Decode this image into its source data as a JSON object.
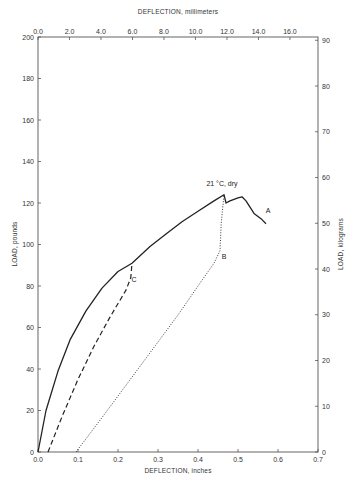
{
  "chart_data": {
    "type": "line",
    "title": "",
    "xlabel": "DEFLECTION, inches",
    "ylabel": "LOAD, pounds",
    "x2label": "DEFLECTION, millimeters",
    "y2label": "LOAD, kilograms",
    "xlim": [
      0.0,
      0.7
    ],
    "ylim": [
      0,
      200
    ],
    "x2lim_mm": [
      0.0,
      17.78
    ],
    "y2lim_kg": [
      0,
      90.7
    ],
    "grid": false,
    "x_ticks": [
      "0.0",
      "0.1",
      "0.2",
      "0.3",
      "0.4",
      "0.5",
      "0.6",
      "0.7"
    ],
    "y_ticks": [
      "0",
      "20",
      "40",
      "60",
      "80",
      "100",
      "120",
      "140",
      "160",
      "180",
      "200"
    ],
    "x2_ticks": [
      "0.0",
      "2.0",
      "4.0",
      "6.0",
      "8.0",
      "10.0",
      "12.0",
      "14.0",
      "16.0"
    ],
    "y2_ticks": [
      "0",
      "10",
      "20",
      "30",
      "40",
      "50",
      "60",
      "70",
      "80",
      "90"
    ],
    "annotations": [
      {
        "text": "21 °C, dry",
        "x": 0.46,
        "y": 128
      },
      {
        "text": "A",
        "x": 0.575,
        "y": 115
      },
      {
        "text": "B",
        "x": 0.465,
        "y": 93
      },
      {
        "text": "C",
        "x": 0.24,
        "y": 82
      }
    ],
    "series": [
      {
        "name": "A",
        "style": "solid",
        "x": [
          0.0,
          0.02,
          0.05,
          0.08,
          0.12,
          0.16,
          0.2,
          0.235,
          0.28,
          0.32,
          0.36,
          0.4,
          0.44,
          0.465,
          0.47,
          0.48,
          0.5,
          0.51,
          0.52,
          0.54,
          0.56,
          0.57
        ],
        "y": [
          0,
          20,
          39,
          54,
          68,
          79,
          87,
          91,
          99,
          105,
          111,
          116,
          121,
          124,
          120,
          121,
          122.5,
          123,
          121,
          115,
          112,
          110
        ]
      },
      {
        "name": "B",
        "style": "dotted",
        "x": [
          0.095,
          0.15,
          0.2,
          0.25,
          0.3,
          0.35,
          0.4,
          0.44,
          0.455,
          0.458,
          0.465
        ],
        "y": [
          0,
          14,
          27,
          40,
          53,
          66,
          80,
          91,
          97,
          110,
          124
        ]
      },
      {
        "name": "C",
        "style": "dashed",
        "x": [
          0.025,
          0.06,
          0.1,
          0.14,
          0.18,
          0.22,
          0.232,
          0.235
        ],
        "y": [
          0,
          17,
          35,
          51,
          65,
          78,
          84,
          91
        ]
      }
    ]
  }
}
